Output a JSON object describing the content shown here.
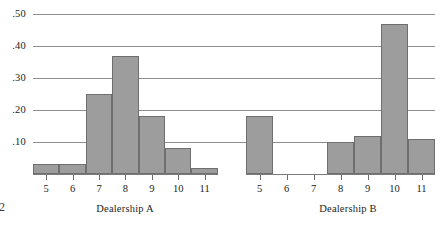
{
  "chart_data": {
    "type": "bar",
    "title": "",
    "subtitle": "",
    "xlabel": "",
    "ylabel": "",
    "ylim": [
      0,
      0.5
    ],
    "grid": true,
    "legend": "none",
    "y_ticks": [
      0.1,
      0.2,
      0.3,
      0.4,
      0.5
    ],
    "y_tick_labels": [
      ".10",
      ".20",
      ".30",
      ".40",
      ".50"
    ],
    "categories": [
      "5",
      "6",
      "7",
      "8",
      "9",
      "10",
      "11"
    ],
    "panels": [
      {
        "name": "Dealership A",
        "label": "Dealership A",
        "categories": [
          "5",
          "6",
          "7",
          "8",
          "9",
          "10",
          "11"
        ],
        "values": [
          0.03,
          0.03,
          0.25,
          0.37,
          0.18,
          0.08,
          0.02
        ]
      },
      {
        "name": "Dealership B",
        "label": "Dealership B",
        "categories": [
          "5",
          "6",
          "7",
          "8",
          "9",
          "10",
          "11"
        ],
        "values": [
          0.18,
          0.0,
          0.0,
          0.1,
          0.12,
          0.47,
          0.11
        ]
      }
    ]
  },
  "style": {
    "bar_fill": "#9d9d9d",
    "bar_edge": "#6f6f6f",
    "grid_color": "#8d8d8d",
    "axis_color": "#7b7b7b",
    "text_color": "#1d1d1d",
    "background": "#ffffff"
  },
  "corner": {
    "mark": "2"
  }
}
